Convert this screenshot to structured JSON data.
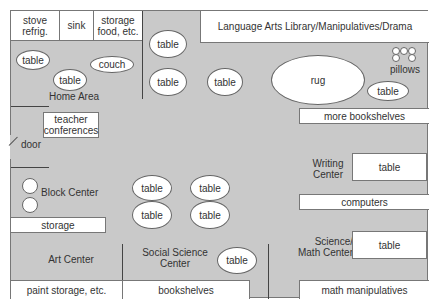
{
  "floor_plan": {
    "kitchen": {
      "stove": "stove\nrefrig.",
      "stove_l1": "stove",
      "stove_l2": "refrig.",
      "sink": "sink",
      "storage_l1": "storage",
      "storage_l2": "food, etc."
    },
    "home_area": {
      "label": "Home Area",
      "table1": "table",
      "table2": "table",
      "couch": "couch"
    },
    "center_tables": {
      "top1": "table",
      "top2": "table",
      "top3": "table",
      "mid1": "table",
      "mid2": "table",
      "mid3": "table",
      "mid4": "table"
    },
    "language_arts": {
      "label": "Language Arts Library/Manipulatives/Drama",
      "rug": "rug",
      "pillows": "pillows",
      "table": "table",
      "more_bookshelves": "more bookshelves"
    },
    "teacher_conferences": {
      "l1": "teacher",
      "l2": "conferences"
    },
    "door": "door",
    "block_center": {
      "label": "Block Center",
      "storage": "storage"
    },
    "writing_center": {
      "l1": "Writing",
      "l2": "Center",
      "table": "table",
      "computers": "computers"
    },
    "art_center": {
      "label": "Art Center",
      "storage": "paint storage, etc."
    },
    "social_science": {
      "l1": "Social Science",
      "l2": "Center",
      "table": "table",
      "bookshelves": "bookshelves"
    },
    "science_math": {
      "l1": "Science/",
      "l2": "Math Center",
      "table": "table",
      "manipulatives": "math manipulatives"
    }
  }
}
